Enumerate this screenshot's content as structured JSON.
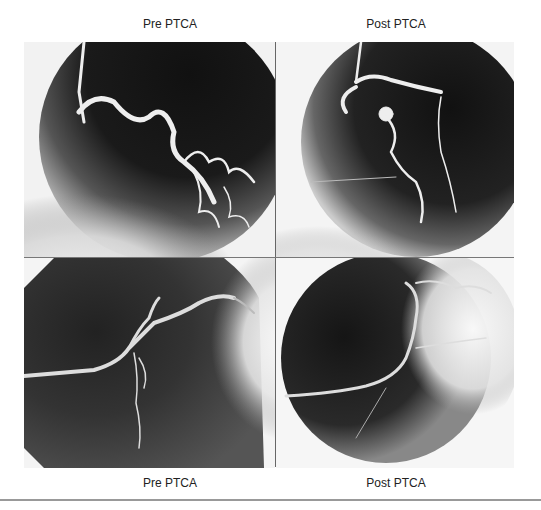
{
  "figure": {
    "panels": [
      {
        "id": "top-left",
        "label": "Pre PTCA",
        "position": "top"
      },
      {
        "id": "top-right",
        "label": "Post PTCA",
        "position": "top"
      },
      {
        "id": "bottom-left",
        "label": "Pre PTCA",
        "position": "bottom"
      },
      {
        "id": "bottom-right",
        "label": "Post PTCA",
        "position": "bottom"
      }
    ],
    "content_type": "coronary angiogram"
  }
}
